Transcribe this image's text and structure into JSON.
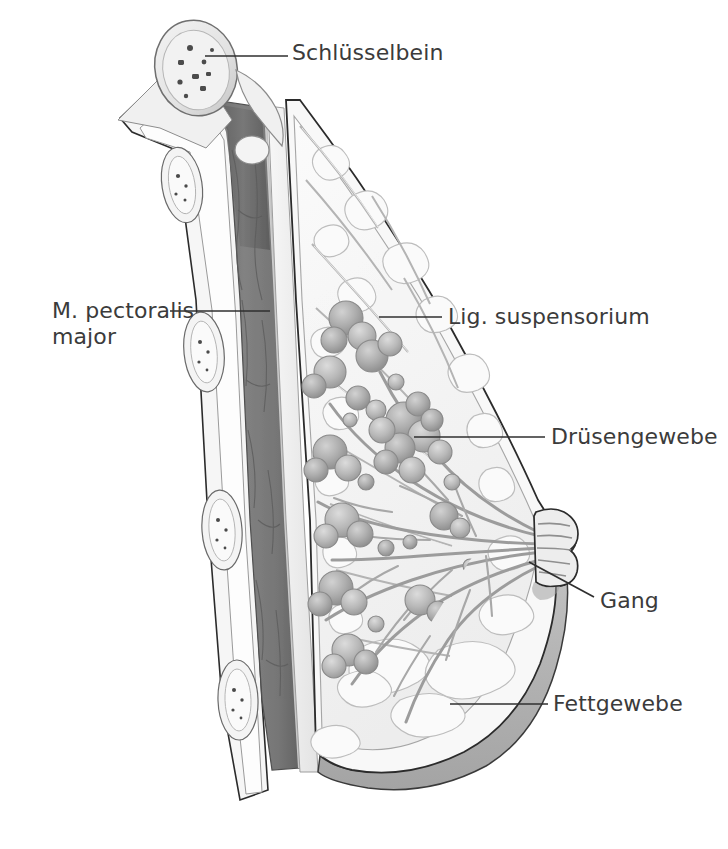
{
  "figure": {
    "type": "anatomical-illustration",
    "language": "de",
    "background_color": "#ffffff",
    "label_color": "#3b3b3b",
    "leader_color": "#2f2f2f"
  },
  "labels": [
    {
      "id": "schluesselbein",
      "text": "Schlüsselbein",
      "side": "right",
      "text_x": 292,
      "text_y": 40,
      "leader": {
        "x1": 205,
        "y1": 56,
        "x2": 288,
        "y2": 56
      },
      "target": "clavicle-bone"
    },
    {
      "id": "m-pectoralis-major",
      "text": "M. pectoralis\nmajor",
      "side": "left",
      "text_x": 52,
      "text_y": 298,
      "leader": {
        "x1": 170,
        "y1": 311,
        "x2": 270,
        "y2": 311
      },
      "target": "pectoralis-major-muscle"
    },
    {
      "id": "lig-suspensorium",
      "text": "Lig. suspensorium",
      "side": "right",
      "text_x": 448,
      "text_y": 304,
      "leader": {
        "x1": 379,
        "y1": 317,
        "x2": 442,
        "y2": 317
      },
      "target": "suspensory-ligament"
    },
    {
      "id": "druesengewebe",
      "text": "Drüsengewebe",
      "side": "right",
      "text_x": 551,
      "text_y": 424,
      "leader": {
        "x1": 414,
        "y1": 437,
        "x2": 545,
        "y2": 437
      },
      "target": "glandular-tissue"
    },
    {
      "id": "gang",
      "text": "Gang",
      "side": "right",
      "text_x": 600,
      "text_y": 588,
      "leader": {
        "x1": 529,
        "y1": 562,
        "x2": 594,
        "y2": 597
      },
      "target": "lactiferous-duct"
    },
    {
      "id": "fettgewebe",
      "text": "Fettgewebe",
      "side": "right",
      "text_x": 553,
      "text_y": 691,
      "leader": {
        "x1": 450,
        "y1": 704,
        "x2": 548,
        "y2": 704
      },
      "target": "adipose-tissue"
    }
  ],
  "structures": [
    {
      "id": "clavicle-bone",
      "name": "Schlüsselbein (Klavikula)",
      "fill": "#e8e8e8"
    },
    {
      "id": "pectoralis-major-muscle",
      "name": "M. pectoralis major",
      "fill": "#7c7c7c"
    },
    {
      "id": "ribs",
      "name": "Rippen",
      "fill": "#f2f2f2"
    },
    {
      "id": "suspensory-ligament",
      "name": "Lig. suspensorium (Cooper)",
      "fill": "#d9d9d9"
    },
    {
      "id": "glandular-tissue",
      "name": "Drüsengewebe",
      "fill": "#a9a9a9"
    },
    {
      "id": "lactiferous-duct",
      "name": "Milchgang",
      "fill": "#c4c4c4"
    },
    {
      "id": "adipose-tissue",
      "name": "Fettgewebe",
      "fill": "#f4f4f4"
    },
    {
      "id": "skin",
      "name": "Haut",
      "fill": "#ededed"
    },
    {
      "id": "nipple",
      "name": "Mamille",
      "fill": "#e4e4e4"
    },
    {
      "id": "inframammary-shadow",
      "name": "Unterbrustschatten",
      "fill": "#b3b3b3"
    }
  ]
}
